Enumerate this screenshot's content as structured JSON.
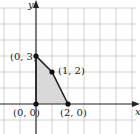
{
  "diagram": {
    "type": "feasible-region-plot",
    "axes": {
      "x_label": "x",
      "y_label": "y"
    },
    "region_fill": "#d9d9d9",
    "grid_color": "#c8c8c8",
    "axis_color": "#222222",
    "vertices": [
      {
        "label": "(0, 0)",
        "x": 0,
        "y": 0
      },
      {
        "label": "(2, 0)",
        "x": 2,
        "y": 0
      },
      {
        "label": "(1, 2)",
        "x": 1,
        "y": 2
      },
      {
        "label": "(0, 3)",
        "x": 0,
        "y": 3
      }
    ]
  }
}
